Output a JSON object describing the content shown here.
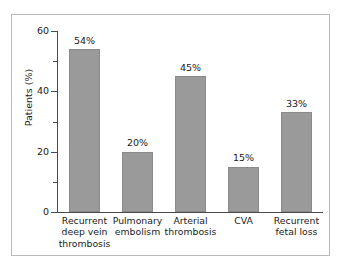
{
  "figure": {
    "background_color": "#ffffff",
    "frame_color": "#b9b9b9",
    "bar_color": "#9a9a9a",
    "axis_color": "#4a4a4a",
    "text_color": "#1a1a1a"
  },
  "chart_data": {
    "type": "bar",
    "title": "",
    "xlabel": "",
    "ylabel": "Patients (%)",
    "ylim": [
      0,
      60
    ],
    "grid": false,
    "legend": null,
    "y_ticks_major": [
      "0",
      "20",
      "40",
      "60"
    ],
    "y_tick_values_major": [
      0,
      20,
      40,
      60
    ],
    "y_tick_values_minor": [
      10,
      30,
      50
    ],
    "categories": [
      "Recurrent deep vein thrombosis",
      "Pulmonary embolism",
      "Arterial thrombosis",
      "CVA",
      "Recurrent fetal loss"
    ],
    "category_lines": [
      [
        "Recurrent",
        "deep vein",
        "thrombosis"
      ],
      [
        "Pulmonary",
        "embolism"
      ],
      [
        "Arterial",
        "thrombosis"
      ],
      [
        "CVA"
      ],
      [
        "Recurrent",
        "fetal loss"
      ]
    ],
    "values": [
      54,
      20,
      45,
      15,
      33
    ],
    "data_labels": [
      "54%",
      "20%",
      "45%",
      "15%",
      "33%"
    ]
  }
}
